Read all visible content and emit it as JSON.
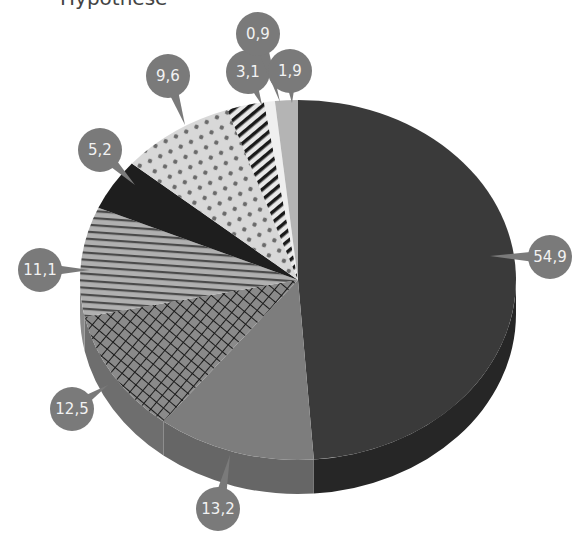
{
  "header": {
    "title_fragment": "Hypothese"
  },
  "colors": {
    "bubble": "#7a7a7a",
    "bubble_text": "#f2f2f2",
    "background": "#ffffff"
  },
  "chart_data": {
    "type": "pie",
    "variant": "3d-exploded-labels",
    "title": "",
    "start_angle": "12 o'clock",
    "direction": "clockwise",
    "decimal_separator": ",",
    "slices": [
      {
        "label": "54,9",
        "value": 54.9,
        "fill": "solid-dark",
        "color": "#3a3a3a"
      },
      {
        "label": "13,2",
        "value": 13.2,
        "fill": "solid-medium",
        "color": "#7d7d7d"
      },
      {
        "label": "12,5",
        "value": 12.5,
        "fill": "crosshatch",
        "color": "#8a8a8a"
      },
      {
        "label": "11,1",
        "value": 11.1,
        "fill": "horizontal-stripes",
        "color": "#a8a8a8"
      },
      {
        "label": "5,2",
        "value": 5.2,
        "fill": "solid-black",
        "color": "#1e1e1e"
      },
      {
        "label": "9,6",
        "value": 9.6,
        "fill": "dots",
        "color": "#d9d9d9"
      },
      {
        "label": "3,1",
        "value": 3.1,
        "fill": "diagonal-stripes",
        "color": "#e6e6e6"
      },
      {
        "label": "0,9",
        "value": 0.9,
        "fill": "solid-white",
        "color": "#efefef"
      },
      {
        "label": "1,9",
        "value": 1.9,
        "fill": "solid-light",
        "color": "#b4b4b4"
      }
    ],
    "legend": null,
    "grid": false
  }
}
